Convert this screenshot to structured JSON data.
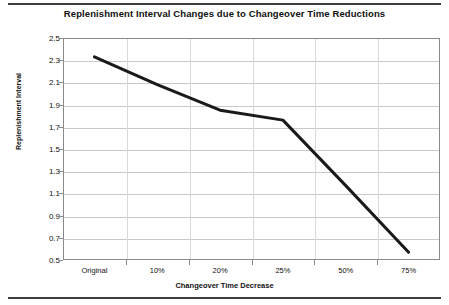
{
  "chart_data": {
    "type": "line",
    "title": "Replenishment Interval Changes due to Changeover Time Reductions",
    "xlabel": "Changeover Time Decrease",
    "ylabel": "Replenishment Interval",
    "categories": [
      "Original",
      "10%",
      "20%",
      "25%",
      "50%",
      "75%"
    ],
    "values": [
      2.33,
      2.08,
      1.85,
      1.76,
      1.17,
      0.57
    ],
    "series": [
      {
        "name": "Replenishment Interval",
        "values": [
          2.33,
          2.08,
          1.85,
          1.76,
          1.17,
          0.57
        ],
        "color": "#1a1a1a"
      }
    ],
    "ylim": [
      0.5,
      2.5
    ],
    "ytick_step": 0.2,
    "ytick_labels": [
      "2.5",
      "2.3",
      "2.1",
      "1.9",
      "1.7",
      "1.5",
      "1.3",
      "1.1",
      "0.9",
      "0.7",
      "0.5"
    ],
    "ytick_values": [
      2.5,
      2.3,
      2.1,
      1.9,
      1.7,
      1.5,
      1.3,
      1.1,
      0.9,
      0.7,
      0.5
    ],
    "grid": true,
    "grid_axis": "y",
    "legend": false,
    "legend_position": "none",
    "line_color": "#1a1a1a",
    "line_width": 3,
    "markers": false
  },
  "figure": {
    "background_color": "#ffffff",
    "border_color": "#8a8a8a",
    "rule_color": "#3d3d3d"
  }
}
